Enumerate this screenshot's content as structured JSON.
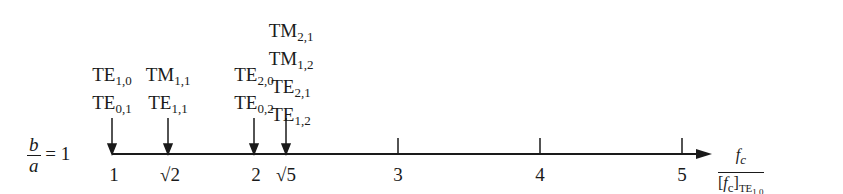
{
  "ratio_label": {
    "numerator": "b",
    "denominator": "a",
    "equals": "= 1"
  },
  "axis_label": {
    "numerator": "f",
    "numerator_sub": "c",
    "denominator": "[f",
    "denominator_sub": "c",
    "denominator_close": "]",
    "denominator_mode": "TE",
    "denominator_mode_sub": "1,0"
  },
  "ticks": [
    {
      "label": "1",
      "value": 1
    },
    {
      "label": "√2",
      "value": 1.414
    },
    {
      "label": "2",
      "value": 2
    },
    {
      "label": "√5",
      "value": 2.236
    },
    {
      "label": "3",
      "value": 3
    },
    {
      "label": "4",
      "value": 4
    },
    {
      "label": "5",
      "value": 5
    }
  ],
  "modes": [
    {
      "value": "1",
      "lines": [
        {
          "m": "TE",
          "s": "1,0"
        },
        {
          "m": "TE",
          "s": "0,1"
        }
      ]
    },
    {
      "value": "√2",
      "lines": [
        {
          "m": "TM",
          "s": "1,1"
        },
        {
          "m": "TE",
          "s": "1,1"
        }
      ]
    },
    {
      "value": "2",
      "lines": [
        {
          "m": "TE",
          "s": "2,0"
        },
        {
          "m": "TE",
          "s": "0,2"
        }
      ]
    },
    {
      "value": "√5",
      "lines": [
        {
          "m": "TM",
          "s": "2,1"
        },
        {
          "m": "TM",
          "s": "1,2"
        },
        {
          "m": "TE",
          "s": "2,1"
        },
        {
          "m": "TE",
          "s": "1,2"
        }
      ]
    }
  ]
}
